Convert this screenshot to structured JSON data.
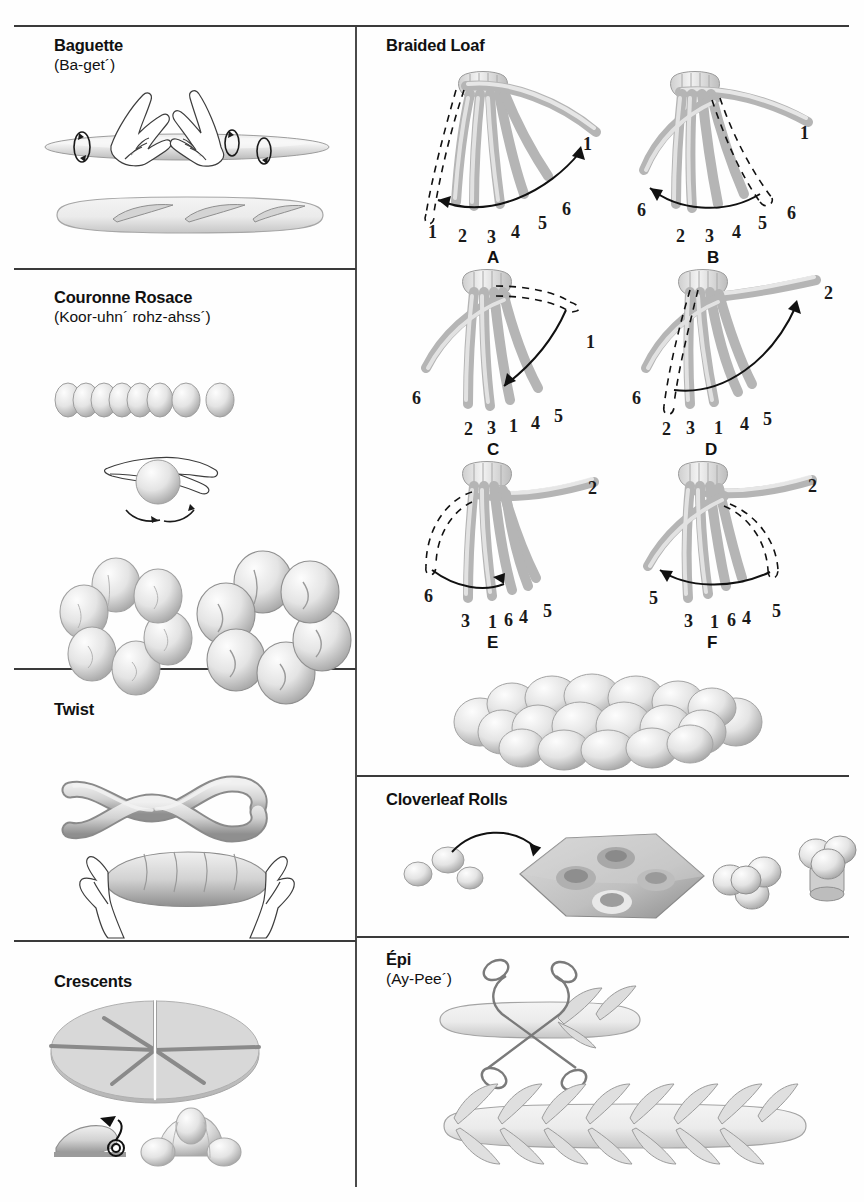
{
  "page": {
    "background": "#ffffff",
    "rule_color": "#3a3a3a",
    "dough_light": "#f2f2f2",
    "dough_mid": "#d8d8d8",
    "dough_dark": "#9a9a9a",
    "outline": "#6e6e6e"
  },
  "panels": {
    "baguette": {
      "title": "Baguette",
      "subtitle": "(Ba-get´)"
    },
    "couronne": {
      "title": "Couronne Rosace",
      "subtitle": "(Koor-uhn´ rohz-ahss´)"
    },
    "twist": {
      "title": "Twist",
      "subtitle": ""
    },
    "crescents": {
      "title": "Crescents",
      "subtitle": ""
    },
    "braided": {
      "title": "Braided Loaf",
      "subtitle": ""
    },
    "cloverleaf": {
      "title": "Cloverleaf Rolls",
      "subtitle": ""
    },
    "epi": {
      "title": "Épi",
      "subtitle": "(Ay-Pee´)"
    }
  },
  "braid_steps": [
    {
      "key": "A",
      "label": "A",
      "bottom_numbers": [
        "1",
        "2",
        "3",
        "4",
        "5",
        "6"
      ],
      "free_numbers": [
        "1"
      ],
      "moving_strand": "1",
      "direction": "right"
    },
    {
      "key": "B",
      "label": "B",
      "bottom_numbers": [
        "2",
        "3",
        "4",
        "5",
        "6"
      ],
      "free_numbers": [
        "6",
        "1"
      ],
      "moving_strand": "6",
      "direction": "left"
    },
    {
      "key": "C",
      "label": "C",
      "bottom_numbers": [
        "2",
        "3",
        "1",
        "4",
        "5"
      ],
      "free_numbers": [
        "6",
        "1"
      ],
      "moving_strand": "1",
      "direction": "left"
    },
    {
      "key": "D",
      "label": "D",
      "bottom_numbers": [
        "2",
        "3",
        "1",
        "4",
        "5"
      ],
      "free_numbers": [
        "6",
        "2"
      ],
      "moving_strand": "2",
      "direction": "right"
    },
    {
      "key": "E",
      "label": "E",
      "bottom_numbers": [
        "3",
        "1",
        "6",
        "4",
        "5"
      ],
      "free_numbers": [
        "6",
        "2"
      ],
      "moving_strand": "6",
      "direction": "right"
    },
    {
      "key": "F",
      "label": "F",
      "bottom_numbers": [
        "3",
        "1",
        "6",
        "4",
        "5"
      ],
      "free_numbers": [
        "5",
        "2",
        "5"
      ],
      "moving_strand": "5",
      "direction": "left"
    }
  ],
  "figures": {
    "baguette_rolling": "hands-rolling-dough-log",
    "baguette_scored": "scored-baguette-loaf",
    "couronne_row": "row-of-eight-dough-balls",
    "couronne_hand": "hand-rounding-dough-ball",
    "couronne_ring_raw": "ring-of-balls-unbaked",
    "couronne_ring_baked": "ring-of-balls-baked",
    "twist_rope": "two-strand-twisted-rope",
    "twist_hands": "hands-holding-twist-loaf",
    "crescents_disc": "dough-disc-cut-in-six-wedges",
    "crescents_rolling": "wedge-rolling-with-arrow",
    "crescents_baked": "baked-croissant-crescent",
    "braided_loaf_finished": "finished-six-strand-braid",
    "cloverleaf_balls": "three-small-dough-balls",
    "cloverleaf_pan": "muffin-pan-with-wells",
    "cloverleaf_raw": "three-balls-in-cup-raw",
    "cloverleaf_baked": "baked-cloverleaf-roll",
    "epi_scissors": "scissors-snipping-baguette",
    "epi_finished": "finished-epi-wheat-stalk-loaf"
  }
}
